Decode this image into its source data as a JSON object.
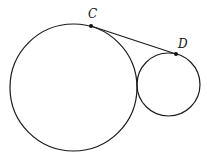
{
  "diagram": {
    "stroke_color": "#1a1a1a",
    "circles": [
      {
        "name": "large-circle",
        "cx": 73.5,
        "cy": 87.5,
        "r": 63.5
      },
      {
        "name": "small-circle",
        "cx": 168.5,
        "cy": 84.5,
        "r": 31.5
      }
    ],
    "segment": {
      "from": "C",
      "to": "D"
    },
    "points": [
      {
        "label": "C",
        "x": 91,
        "y": 26,
        "label_x": 88,
        "label_y": 8
      },
      {
        "label": "D",
        "x": 176,
        "y": 54,
        "label_x": 178,
        "label_y": 38
      }
    ]
  }
}
